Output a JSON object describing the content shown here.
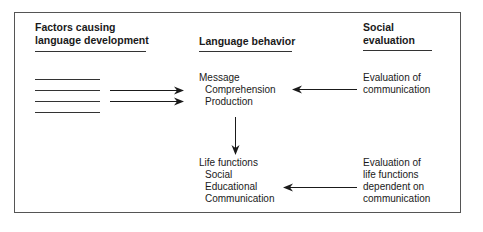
{
  "columns": {
    "factors": {
      "heading_line1": "Factors causing",
      "heading_line2": "language development",
      "blank_line_count": 4
    },
    "behavior": {
      "heading": "Language behavior",
      "message": {
        "title": "Message",
        "items": [
          "Comprehension",
          "Production"
        ]
      },
      "life_functions": {
        "title": "Life functions",
        "items": [
          "Social",
          "Educational",
          "Communication"
        ]
      }
    },
    "social": {
      "heading_line1": "Social",
      "heading_line2": "evaluation",
      "eval_communication": [
        "Evaluation of",
        "communication"
      ],
      "eval_life_functions": [
        "Evaluation of",
        "life functions",
        "dependent on",
        "communication"
      ]
    }
  },
  "arrows": [
    {
      "from": "factors",
      "to": "message",
      "direction": "right"
    },
    {
      "from": "factors",
      "to": "message",
      "direction": "right"
    },
    {
      "from": "evaluation-of-communication",
      "to": "message",
      "direction": "left"
    },
    {
      "from": "message",
      "to": "life-functions",
      "direction": "down"
    },
    {
      "from": "evaluation-of-life-functions",
      "to": "life-functions",
      "direction": "left"
    }
  ],
  "colors": {
    "line": "#1a1a1a",
    "frame": "#555555",
    "background": "#ffffff"
  }
}
